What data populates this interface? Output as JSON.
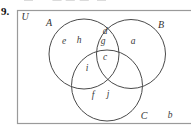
{
  "item_number": "9.",
  "top_clipped_text": "·—· ·· — —·— ·—",
  "diagram": {
    "universal_set_label": "U",
    "set_a_label": "A",
    "set_b_label": "B",
    "set_c_label": "C",
    "letters": {
      "e": "e",
      "h": "h",
      "d": "d",
      "g": "g",
      "a": "a",
      "c": "c",
      "i": "i",
      "f": "f",
      "j": "j",
      "b": "b"
    },
    "regions": {
      "A_only": [
        "e",
        "h"
      ],
      "A_and_B_only": [
        "d",
        "g"
      ],
      "B_only": [
        "a"
      ],
      "A_and_B_and_C": [
        "c"
      ],
      "A_and_C_only": [
        "i"
      ],
      "C_only": [
        "f",
        "j"
      ],
      "outside_circles": [
        "b"
      ]
    },
    "colors": {
      "frame_border": "#9a9a9a",
      "circle_stroke": "#4a4a4a",
      "label_text": "#3a3a3a"
    }
  }
}
